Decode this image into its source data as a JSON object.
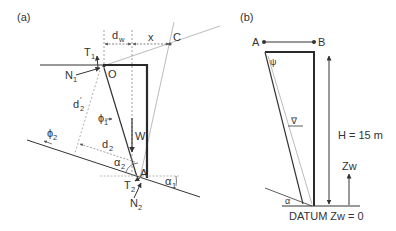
{
  "panel_a": {
    "label": "(a)",
    "points": {
      "O": "O",
      "A": "A",
      "C": "C"
    },
    "forces": {
      "T1": {
        "main": "T",
        "sub": "1"
      },
      "N1": {
        "main": "N",
        "sub": "1"
      },
      "T2": {
        "main": "T",
        "sub": "2"
      },
      "N2": {
        "main": "N",
        "sub": "2"
      },
      "W": "W"
    },
    "distances": {
      "dw": {
        "main": "d",
        "sub": "w"
      },
      "x": "x",
      "d2prime": {
        "main": "d",
        "sub": "2",
        "prime": "′"
      },
      "d2": {
        "main": "d",
        "sub": "2"
      }
    },
    "angles": {
      "phi1": {
        "main": "ϕ",
        "sub": "1"
      },
      "phi2": {
        "main": "ϕ",
        "sub": "2"
      },
      "alpha1": {
        "main": "α",
        "sub": "1"
      },
      "alpha2": {
        "main": "α",
        "sub": "2"
      }
    }
  },
  "panel_b": {
    "label": "(b)",
    "points": {
      "A": "A",
      "B": "B"
    },
    "psi": "ψ",
    "water_symbol": "∇",
    "height_label": "H = 15 m",
    "zw_label": "Zw",
    "datum_label": "DATUM Zw = 0",
    "alpha": "α"
  },
  "colors": {
    "line": "#333333",
    "heavy": "#2a2a2a",
    "light": "#9a9a9a",
    "dashed": "#8a8a8a"
  }
}
